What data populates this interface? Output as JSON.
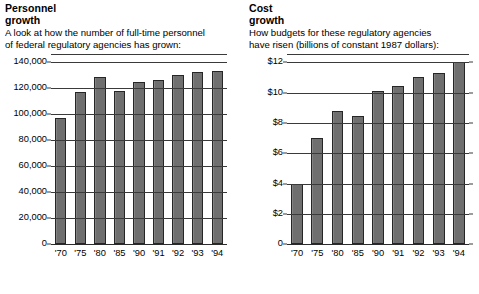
{
  "panels": {
    "left": {
      "title": "Personnel\ngrowth",
      "subtitle": "A look at how the number of full-time personnel\nof federal regulatory agencies has grown:"
    },
    "right": {
      "title": "Cost\ngrowth",
      "subtitle": "How budgets for these regulatory agencies\nhave risen (billions of constant 1987 dollars):"
    }
  },
  "colors": {
    "bar_fill": "#6f6f6f",
    "bar_stroke": "#262626",
    "gridline": "#3a3a3a",
    "text": "#000000",
    "background": "#ffffff"
  },
  "chart_data": [
    {
      "type": "bar",
      "id": "personnel-growth",
      "title": "Personnel growth",
      "subtitle": "A look at how the number of full-time personnel of federal regulatory agencies has grown:",
      "xlabel": "",
      "ylabel": "",
      "categories": [
        "'70",
        "'75",
        "'80",
        "'85",
        "'90",
        "'91",
        "'92",
        "'93",
        "'94"
      ],
      "values": [
        97000,
        117000,
        129000,
        117500,
        125000,
        126500,
        130000,
        132500,
        133500
      ],
      "ylim": [
        0,
        140000
      ],
      "yticks": [
        0,
        20000,
        40000,
        60000,
        80000,
        100000,
        120000,
        140000
      ],
      "ytick_labels": [
        "0",
        "20,000",
        "40,000",
        "60,000",
        "80,000",
        "100,000",
        "120,000",
        "140,000"
      ],
      "grid": true,
      "legend": false
    },
    {
      "type": "bar",
      "id": "cost-growth",
      "title": "Cost growth",
      "subtitle": "How budgets for these regulatory agencies have risen (billions of constant 1987 dollars):",
      "xlabel": "",
      "ylabel": "billions of constant 1987 dollars",
      "categories": [
        "'70",
        "'75",
        "'80",
        "'85",
        "'90",
        "'91",
        "'92",
        "'93",
        "'94"
      ],
      "values": [
        4.0,
        7.0,
        8.8,
        8.45,
        10.1,
        10.45,
        11.05,
        11.3,
        12.0
      ],
      "ylim": [
        0,
        12
      ],
      "yticks": [
        0,
        2,
        4,
        6,
        8,
        10,
        12
      ],
      "ytick_labels": [
        "0",
        "$2",
        "$4",
        "$6",
        "$8",
        "$10",
        "$12"
      ],
      "grid": true,
      "legend": false
    }
  ]
}
